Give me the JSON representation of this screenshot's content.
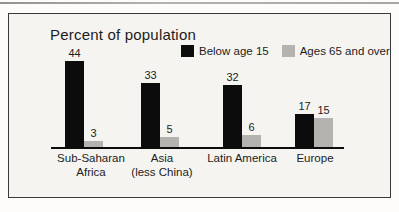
{
  "figure": {
    "title": "Percent of population",
    "frame": "single-line box on light gray panel"
  },
  "chart_data": {
    "type": "bar",
    "title": "Percent of population",
    "categories": [
      {
        "lines": [
          "Sub-Saharan",
          "Africa"
        ]
      },
      {
        "lines": [
          "Asia",
          "(less China)"
        ]
      },
      {
        "lines": [
          "Latin America"
        ]
      },
      {
        "lines": [
          "Europe"
        ]
      }
    ],
    "series": [
      {
        "name": "Below age 15",
        "color": "#0c0c0c",
        "style": "solid-black",
        "values": [
          44,
          33,
          32,
          17
        ]
      },
      {
        "name": "Ages 65 and over",
        "color": "#b5b3b0",
        "style": "dotted-gray-halftone",
        "values": [
          3,
          5,
          6,
          15
        ]
      }
    ],
    "value_labels": {
      "Below age 15": [
        44,
        33,
        32,
        17
      ],
      "Ages 65 and over": [
        3,
        5,
        6,
        15
      ]
    },
    "ylabel": "",
    "xlabel": "",
    "ylim": [
      0,
      50
    ],
    "grid": false,
    "axes_shown": "x-baseline-only",
    "legend_position": "top-right-inside",
    "unit": "percent"
  },
  "layout_constants": {
    "group_black_bar_lefts": [
      56,
      132,
      214,
      286
    ],
    "category_centers": [
      82,
      153,
      233,
      306
    ],
    "bar_width": 19,
    "baseline_y": 133,
    "px_per_unit": 1.95
  }
}
